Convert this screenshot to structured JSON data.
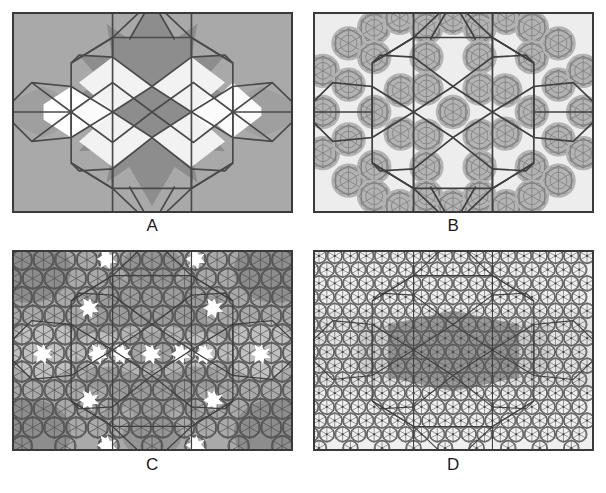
{
  "figure": {
    "type": "multi-panel-geometric-tiling-figure",
    "background_color": "#ffffff",
    "width": 606,
    "height": 493,
    "panel_count": 4,
    "layout": "2x2 grid",
    "frame_color": "#3a3a3a",
    "label_color": "#1c1c1c"
  },
  "panels": [
    {
      "id": "A",
      "label": "A",
      "description": "Coarse level-0 substitution tile: shaded hexagon and star regions with heavy polygon outlines",
      "background_color": "#a9a9a9",
      "fill_dark": "#8d8d8d",
      "fill_mid": "#a0a0a0",
      "fill_light": "#f4f4f4",
      "fill_white": "#ffffff",
      "outline_color": "#4a4a4a",
      "outline_width": 1.6,
      "grid_scale": 1,
      "tile_count": 13
    },
    {
      "id": "B",
      "label": "B",
      "description": "First inflation: overlapping dodecagonal rosettes of fine star lattice on pale ground",
      "background_color": "#ededed",
      "fill_dark": "#b3b3b3",
      "fill_mid": "#c8c8c8",
      "fill_light": "#f4f4f4",
      "fill_white": "#ffffff",
      "outline_color": "#4a4a4a",
      "outline_width": 1.6,
      "grid_scale": 2,
      "tile_count": 61
    },
    {
      "id": "C",
      "label": "C",
      "description": "Second inflation: dense multi-tone tiling with white star defects",
      "background_color": "#a9a9a9",
      "fill_dark": "#8a8a8a",
      "fill_mid": "#9e9e9e",
      "fill_light": "#c4c4c4",
      "fill_white": "#ffffff",
      "outline_color": "#4a4a4a",
      "outline_width": 1.0,
      "grid_scale": 3,
      "tile_count": 181
    },
    {
      "id": "D",
      "label": "D",
      "description": "Third inflation: fine quasiperiodic net on light ground with dark central band",
      "background_color": "#efefef",
      "fill_dark": "#8d8d8d",
      "fill_mid": "#b8b8b8",
      "fill_light": "#dedede",
      "fill_white": "#ffffff",
      "outline_color": "#4a4a4a",
      "outline_width": 0.8,
      "grid_scale": 4,
      "tile_count": 421
    }
  ],
  "labels": {
    "a": "A",
    "b": "B",
    "c": "C",
    "d": "D"
  }
}
